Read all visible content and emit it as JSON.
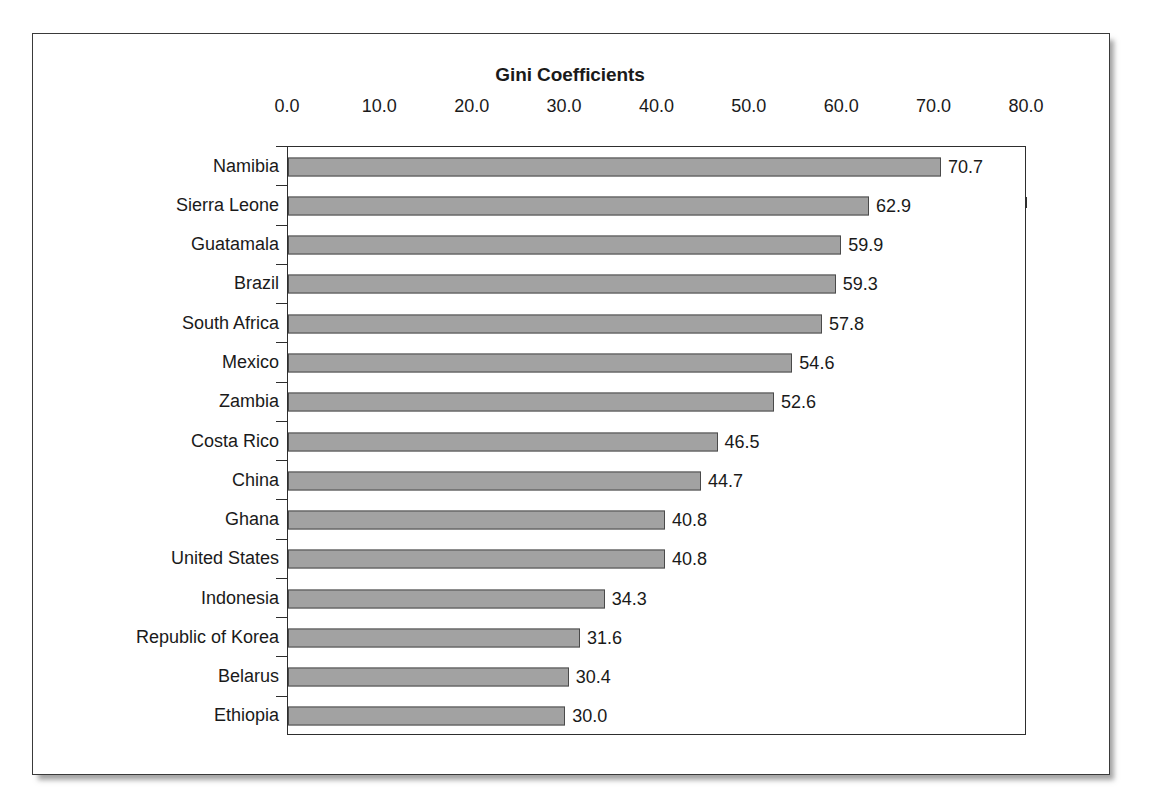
{
  "chart_data": {
    "type": "bar",
    "orientation": "horizontal",
    "title": "Gini Coefficients",
    "xlabel": "",
    "ylabel": "",
    "xlim": [
      0.0,
      80.0
    ],
    "xticks": [
      "0.0",
      "10.0",
      "20.0",
      "30.0",
      "40.0",
      "50.0",
      "60.0",
      "70.0",
      "80.0"
    ],
    "xtick_values": [
      0,
      10,
      20,
      30,
      40,
      50,
      60,
      70,
      80
    ],
    "grid": false,
    "legend": false,
    "axis_position": "top",
    "bar_color": "#a2a2a2",
    "bar_edge_color": "#4a4a4a",
    "axis_color": "#2e2e2e",
    "text_color": "#1a1a1a",
    "categories": [
      "Namibia",
      "Sierra Leone",
      "Guatamala",
      "Brazil",
      "South Africa",
      "Mexico",
      "Zambia",
      "Costa Rico",
      "China",
      "Ghana",
      "United States",
      "Indonesia",
      "Republic of Korea",
      "Belarus",
      "Ethiopia"
    ],
    "values": [
      70.7,
      62.9,
      59.9,
      59.3,
      57.8,
      54.6,
      52.6,
      46.5,
      44.7,
      40.8,
      40.8,
      34.3,
      31.6,
      30.4,
      30.0
    ],
    "value_labels": [
      "70.7",
      "62.9",
      "59.9",
      "59.3",
      "57.8",
      "54.6",
      "52.6",
      "46.5",
      "44.7",
      "40.8",
      "40.8",
      "34.3",
      "31.6",
      "30.4",
      "30.0"
    ]
  }
}
